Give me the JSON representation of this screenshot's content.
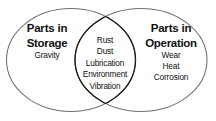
{
  "diagram": {
    "kind": "venn-diagram",
    "background_color": "#ffffff",
    "text_color": "#111111",
    "outline_color": "#6b6b6b",
    "intersection_outline_color": "#1a1a1a",
    "left_set": {
      "title_line1": "Parts in",
      "title_line2": "Storage",
      "items": [
        "Gravity"
      ]
    },
    "right_set": {
      "title_line1": "Parts in",
      "title_line2": "Operation",
      "items": [
        "Wear",
        "Heat",
        "Corrosion"
      ]
    },
    "intersection": {
      "items": [
        "Rust",
        "Dust",
        "Lubrication",
        "Environment",
        "Vibration"
      ]
    }
  }
}
